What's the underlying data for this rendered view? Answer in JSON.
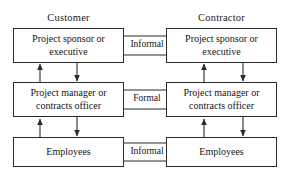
{
  "diagram": {
    "type": "organizational-communication-diagram",
    "colors": {
      "background": "#ffffff",
      "box_border": "#2b2b2b",
      "box_fill": "#ffffff",
      "arrow": "#2b2b2b",
      "text": "#151515"
    },
    "columns": [
      {
        "id": "customer",
        "heading": "Customer"
      },
      {
        "id": "contractor",
        "heading": "Contractor"
      }
    ],
    "nodes": {
      "customer_sponsor": "Project sponsor or executive",
      "customer_sponsor_line1": "Project sponsor or",
      "customer_sponsor_line2": "executive",
      "customer_manager": "Project manager or contracts officer",
      "customer_manager_line1": "Project manager or",
      "customer_manager_line2": "contracts officer",
      "customer_employees": "Employees",
      "contractor_sponsor": "Project sponsor or executive",
      "contractor_sponsor_line1": "Project sponsor or",
      "contractor_sponsor_line2": "executive",
      "contractor_manager": "Project manager or contracts officer",
      "contractor_manager_line1": "Project manager or",
      "contractor_manager_line2": "contracts officer",
      "contractor_employees": "Employees"
    },
    "edge_labels": {
      "top": "Informal",
      "middle": "Formal",
      "bottom": "Informal"
    },
    "horizontal_links": [
      {
        "row": "sponsor",
        "label": "Informal",
        "direction": "bidirectional"
      },
      {
        "row": "manager",
        "label": "Formal",
        "direction": "bidirectional"
      },
      {
        "row": "employees",
        "label": "Informal",
        "direction": "bidirectional"
      }
    ],
    "vertical_links": [
      {
        "column": "customer",
        "between": "sponsor-manager",
        "direction": "bidirectional"
      },
      {
        "column": "customer",
        "between": "manager-employees",
        "direction": "bidirectional"
      },
      {
        "column": "contractor",
        "between": "sponsor-manager",
        "direction": "bidirectional"
      },
      {
        "column": "contractor",
        "between": "manager-employees",
        "direction": "bidirectional"
      }
    ]
  }
}
